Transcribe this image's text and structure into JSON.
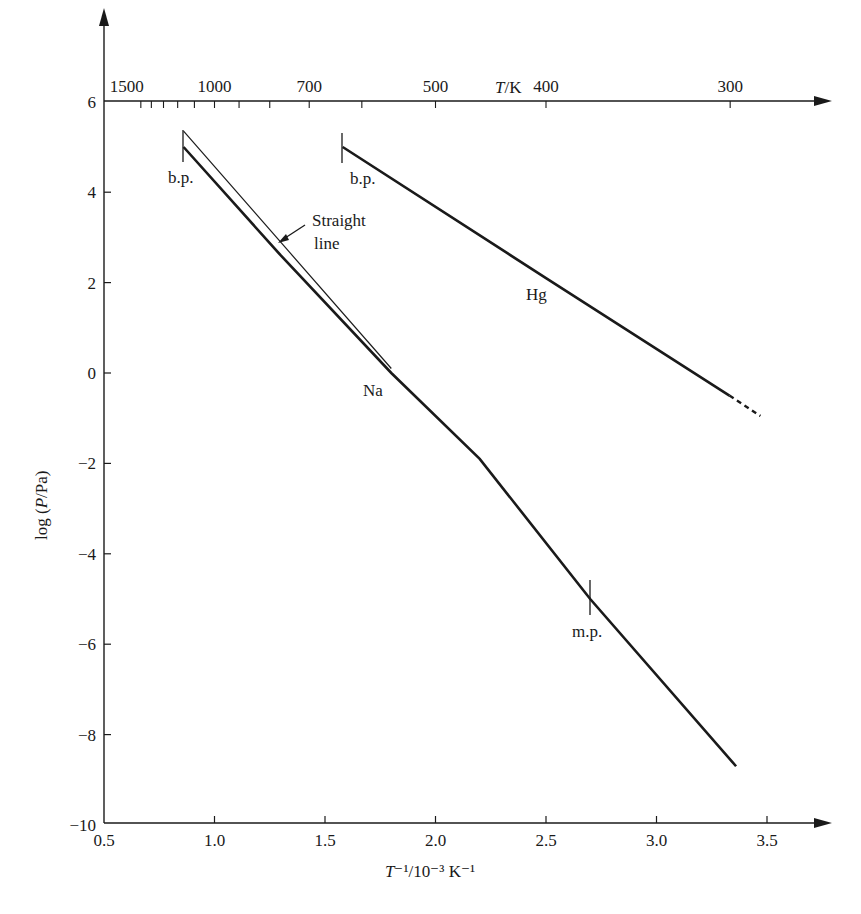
{
  "chart_data": {
    "type": "line",
    "title": "",
    "xlabel": "T⁻¹/10⁻³ K⁻¹",
    "ylabel": "log (P/Pa)",
    "top_xlabel": "T/K",
    "xlim": [
      0.5,
      3.7
    ],
    "ylim": [
      -10,
      6
    ],
    "grid": false,
    "x_ticks": [
      0.5,
      1.0,
      1.5,
      2.0,
      2.5,
      3.0,
      3.5
    ],
    "x_tick_labels": [
      "0.5",
      "1.0",
      "1.5",
      "2.0",
      "2.5",
      "3.0",
      "3.5"
    ],
    "y_ticks": [
      6,
      4,
      2,
      0,
      -2,
      -4,
      -6,
      -8,
      -10
    ],
    "y_tick_labels": [
      "6",
      "4",
      "2",
      "0",
      "−2",
      "−4",
      "−6",
      "−8",
      "−10"
    ],
    "top_ticks_labeled": [
      {
        "T": 1500,
        "label": "1500"
      },
      {
        "T": 1000,
        "label": "1000"
      },
      {
        "T": 700,
        "label": "700"
      },
      {
        "T": 500,
        "label": "500"
      },
      {
        "T": 400,
        "label": "400"
      },
      {
        "T": 300,
        "label": "300"
      }
    ],
    "top_ticks_minor_T": [
      1500,
      1400,
      1300,
      1200,
      1100,
      1000,
      900,
      800,
      700,
      600,
      500,
      400,
      300
    ],
    "series": [
      {
        "name": "Na",
        "style": "solid-thick",
        "x": [
          0.86,
          1.3,
          1.8,
          2.2,
          2.7,
          3.36
        ],
        "y": [
          5.0,
          2.6,
          0.0,
          -1.9,
          -5.0,
          -8.7
        ]
      },
      {
        "name": "Straight line",
        "style": "solid-thin",
        "x": [
          0.86,
          1.8
        ],
        "y": [
          5.35,
          0.1
        ]
      },
      {
        "name": "Hg",
        "style": "solid-thick",
        "x": [
          1.58,
          2.5,
          3.33
        ],
        "y": [
          5.0,
          2.1,
          -0.5
        ]
      },
      {
        "name": "Hg (extrapolated)",
        "style": "dashed",
        "x": [
          3.33,
          3.47
        ],
        "y": [
          -0.5,
          -0.95
        ]
      }
    ],
    "annotations": [
      {
        "text": "b.p.",
        "x": 0.86,
        "y": 5.0,
        "series": "Na"
      },
      {
        "text": "b.p.",
        "x": 1.58,
        "y": 5.0,
        "series": "Hg"
      },
      {
        "text": "m.p.",
        "x": 2.7,
        "y": -5.0,
        "series": "Na"
      },
      {
        "text": "Straight line",
        "x": 1.45,
        "y": 3.2
      },
      {
        "text": "Na",
        "x": 1.8,
        "y": -0.3
      },
      {
        "text": "Hg",
        "x": 2.45,
        "y": 1.6
      }
    ]
  },
  "labels": {
    "xlabel_T": "T",
    "xlabel_rest": "⁻¹/10⁻³ K⁻¹",
    "ylabel_log": "log (",
    "ylabel_P": "P",
    "ylabel_rest": "/Pa)",
    "top_T": "T",
    "top_rest": "/K",
    "bp1": "b.p.",
    "bp2": "b.p.",
    "mp": "m.p.",
    "straight1": "Straight",
    "straight2": "line",
    "na": "Na",
    "hg": "Hg"
  }
}
